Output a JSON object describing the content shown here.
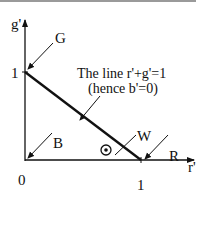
{
  "diagram": {
    "axes": {
      "y_label": "g'",
      "x_label": "r'",
      "origin_label": "0",
      "y_tick_label": "1",
      "x_tick_label": "1"
    },
    "points": {
      "G": "G",
      "B": "B",
      "R": "R",
      "W": "W"
    },
    "annotation": {
      "line1": "The line r'+g'=1",
      "line2": "(hence b'=0)"
    },
    "colors": {
      "ink": "#111111",
      "topbar": "#9a9a9a"
    }
  }
}
